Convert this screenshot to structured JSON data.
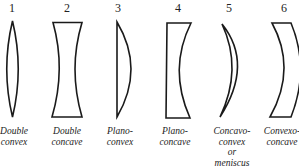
{
  "diagram": {
    "lenses": [
      {
        "number": "1",
        "label_lines": [
          "Double",
          "convex"
        ],
        "shape": "double-convex"
      },
      {
        "number": "2",
        "label_lines": [
          "Double",
          "concave"
        ],
        "shape": "double-concave"
      },
      {
        "number": "3",
        "label_lines": [
          "Plano-",
          "convex"
        ],
        "shape": "plano-convex"
      },
      {
        "number": "4",
        "label_lines": [
          "Plano-",
          "concave"
        ],
        "shape": "plano-concave"
      },
      {
        "number": "5",
        "label_lines": [
          "Concavo-",
          "convex",
          "or",
          "meniscus"
        ],
        "shape": "concavo-convex-meniscus"
      },
      {
        "number": "6",
        "label_lines": [
          "Convexo-",
          "concave"
        ],
        "shape": "convexo-concave"
      }
    ],
    "colors": {
      "stroke": "#1a1a1a",
      "text": "#222222",
      "background": "#ffffff"
    }
  }
}
